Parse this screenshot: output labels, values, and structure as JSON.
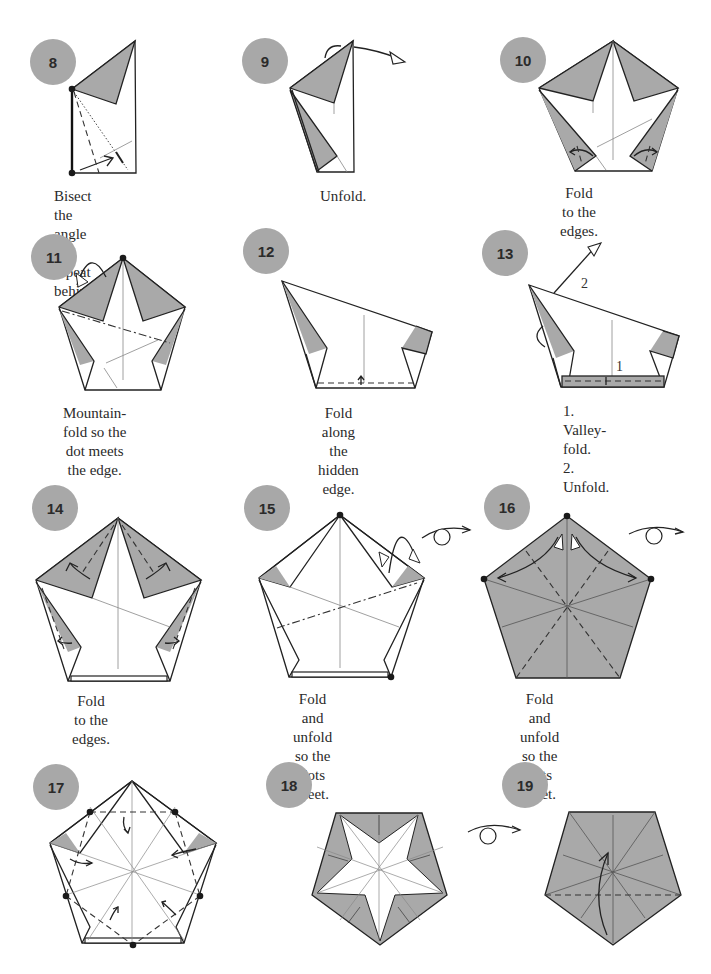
{
  "diagram": {
    "colors": {
      "badge": "#a8a8a8",
      "paper_colored": "#a9a9a9",
      "paper_white": "#ffffff",
      "line": "#222222"
    },
    "steps": [
      {
        "number": "8",
        "caption": "Bisect the angle\nand repeat behind."
      },
      {
        "number": "9",
        "caption": "Unfold."
      },
      {
        "number": "10",
        "caption": "Fold to the edges."
      },
      {
        "number": "11",
        "caption": "Mountain-fold so the\ndot meets the edge."
      },
      {
        "number": "12",
        "caption": "Fold along the\nhidden edge."
      },
      {
        "number": "13",
        "caption": "1. Valley-fold.\n2. Unfold.",
        "labels": [
          "1",
          "2"
        ]
      },
      {
        "number": "14",
        "caption": "Fold to the edges."
      },
      {
        "number": "15",
        "caption": "Fold and unfold\nso the dots meet."
      },
      {
        "number": "16",
        "caption": "Fold and unfold\nso the dots meet."
      },
      {
        "number": "17",
        "caption": ""
      },
      {
        "number": "18",
        "caption": ""
      },
      {
        "number": "19",
        "caption": ""
      }
    ],
    "symbols": {
      "turn_over": "turn-over-arrow",
      "valley_fold": "dashed-line",
      "mountain_fold": "dash-dot-line",
      "unfold_arrow": "hollow-arrowhead"
    }
  }
}
